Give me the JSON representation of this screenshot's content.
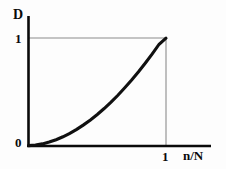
{
  "figure": {
    "background_color": "#fdfdfd",
    "axis_color": "#0a0a0a",
    "grid_color": "#8c8c8c",
    "curve_color": "#101010"
  },
  "labels": {
    "y_axis_title": "D",
    "x_axis_title": "n/N",
    "y_tick_one": "1",
    "origin": "0",
    "x_tick_one": "1"
  },
  "chart_data": {
    "type": "line",
    "title": "",
    "subtitle": "",
    "xlabel": "n/N",
    "ylabel": "D",
    "xlim": [
      0,
      1
    ],
    "ylim": [
      0,
      1
    ],
    "xticks": [
      0,
      1
    ],
    "xticklabels": [
      "0",
      "1"
    ],
    "yticks": [
      0,
      1
    ],
    "yticklabels": [
      "0",
      "1"
    ],
    "grid": false,
    "guide_lines": [
      {
        "name": "y-one-horizontal",
        "orientation": "horizontal",
        "value": 1,
        "from": 0,
        "to": 1
      },
      {
        "name": "x-one-vertical",
        "orientation": "vertical",
        "value": 1,
        "from": 0,
        "to": 1
      }
    ],
    "legend": null,
    "legend_position": "none",
    "annotations": [],
    "series": [
      {
        "name": "D(n/N)",
        "description": "monotonically increasing convex curve from (0,0) to (1,1), approximately a power law with exponent near 2.4",
        "x": [
          0.0,
          0.05,
          0.1,
          0.15,
          0.2,
          0.25,
          0.3,
          0.35,
          0.4,
          0.45,
          0.5,
          0.55,
          0.6,
          0.65,
          0.7,
          0.75,
          0.8,
          0.85,
          0.9,
          0.95,
          1.0
        ],
        "y": [
          0.0,
          0.005,
          0.016,
          0.033,
          0.055,
          0.082,
          0.114,
          0.151,
          0.193,
          0.239,
          0.29,
          0.345,
          0.405,
          0.469,
          0.538,
          0.61,
          0.687,
          0.769,
          0.854,
          0.944,
          1.0
        ]
      }
    ]
  }
}
